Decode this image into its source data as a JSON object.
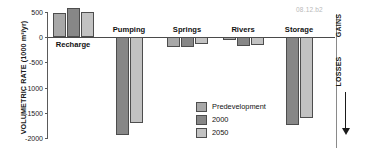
{
  "figure_id": "08.12.b2",
  "chart_data": {
    "type": "bar",
    "title": "",
    "xlabel": "",
    "ylabel": "VOLUMETRIC RATE (1000 m³/yr)",
    "ylim": [
      -2000,
      500
    ],
    "yticks": [
      500,
      0,
      -500,
      -1000,
      -1500,
      -2000
    ],
    "ytick_labels": [
      "500",
      "0",
      "-500",
      "-1000",
      "-1500",
      "-2000"
    ],
    "grid": false,
    "legend_position": "inside-bottom-center",
    "categories": [
      "Recharge",
      "Pumping",
      "Springs",
      "Rivers",
      "Storage"
    ],
    "series": [
      {
        "name": "Predevelopment",
        "color": "#a8a8a8",
        "values": [
          490,
          null,
          -200,
          -60,
          null
        ]
      },
      {
        "name": "2000",
        "color": "#878787",
        "values": [
          570,
          -1950,
          -200,
          -170,
          -1750
        ]
      },
      {
        "name": "2050",
        "color": "#c2c2c2",
        "values": [
          500,
          -1700,
          -130,
          -150,
          -1600
        ]
      }
    ],
    "annotations": [
      {
        "text": "GAINS",
        "position": "right-axis-top"
      },
      {
        "text": "LOSSES",
        "position": "right-axis-below-zero"
      }
    ]
  },
  "legend": {
    "items": [
      {
        "label": "Predevelopment",
        "color": "#a8a8a8"
      },
      {
        "label": "2000",
        "color": "#878787"
      },
      {
        "label": "2050",
        "color": "#c2c2c2"
      }
    ]
  },
  "right_axis": {
    "gains_label": "GAINS",
    "losses_label": "LOSSES"
  }
}
